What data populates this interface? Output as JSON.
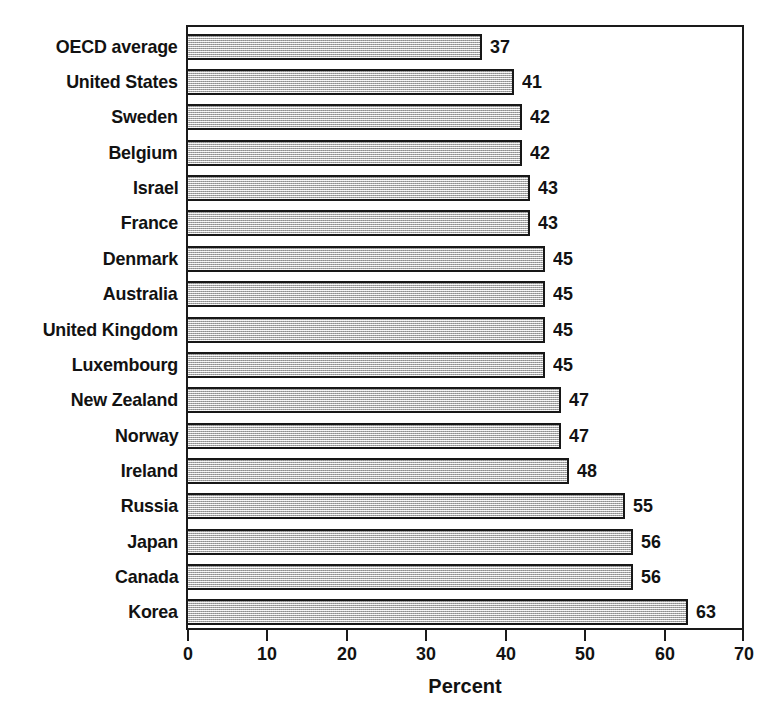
{
  "chart_data": {
    "type": "bar",
    "orientation": "horizontal",
    "title": "",
    "xlabel": "Percent",
    "ylabel": "",
    "xlim": [
      0,
      70
    ],
    "xticks": [
      0,
      10,
      20,
      30,
      40,
      50,
      60,
      70
    ],
    "xtick_labels": [
      "0",
      "10",
      "20",
      "30",
      "40",
      "50",
      "60",
      "70"
    ],
    "grid": false,
    "legend": false,
    "categories": [
      "OECD average",
      "United States",
      "Sweden",
      "Belgium",
      "Israel",
      "France",
      "Denmark",
      "Australia",
      "United Kingdom",
      "Luxembourg",
      "New Zealand",
      "Norway",
      "Ireland",
      "Russia",
      "Japan",
      "Canada",
      "Korea"
    ],
    "values": [
      37,
      41,
      42,
      42,
      43,
      43,
      45,
      45,
      45,
      45,
      47,
      47,
      48,
      55,
      56,
      56,
      63
    ],
    "value_labels": [
      "37",
      "41",
      "42",
      "42",
      "43",
      "43",
      "45",
      "45",
      "45",
      "45",
      "47",
      "47",
      "48",
      "55",
      "56",
      "56",
      "63"
    ],
    "bar_fill_color": "#c9c9c9",
    "bar_edge_color": "#171717",
    "axis_color": "#1a1a1a",
    "text_color": "#121212",
    "background_color": "#ffffff"
  }
}
